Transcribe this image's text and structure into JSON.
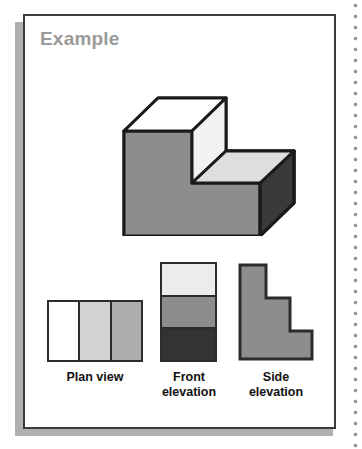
{
  "page": {
    "background_color": "#ffffff",
    "perforation_color": "#9a9a9a"
  },
  "card": {
    "title": "Example",
    "title_color": "#9a9a9a",
    "border_color": "#3b3b3b",
    "shadow_color": "#b0b0b0",
    "background_color": "#ffffff"
  },
  "isometric": {
    "name": "three-step-staircase-solid",
    "outline_color": "#1a1a1a",
    "faces": [
      {
        "name": "top-face-step-1",
        "color": "#ffffff"
      },
      {
        "name": "riser-face-step-1",
        "color": "#efefef"
      },
      {
        "name": "top-face-step-2",
        "color": "#e2e2e2"
      },
      {
        "name": "riser-face-step-2",
        "color": "#d9d9d9"
      },
      {
        "name": "top-face-step-3",
        "color": "#cfcfcf"
      },
      {
        "name": "front-face",
        "color": "#8d8d8d"
      },
      {
        "name": "right-side-face",
        "color": "#3a3a3a"
      }
    ]
  },
  "views": {
    "plan": {
      "label": "Plan view",
      "strips": [
        {
          "name": "strip-near",
          "color": "#ffffff"
        },
        {
          "name": "strip-middle",
          "color": "#d2d2d2"
        },
        {
          "name": "strip-far",
          "color": "#adadad"
        }
      ]
    },
    "front": {
      "label": "Front\nelevation",
      "label_line1": "Front",
      "label_line2": "elevation",
      "bands": [
        {
          "name": "band-top",
          "color": "#ececec"
        },
        {
          "name": "band-middle",
          "color": "#8d8d8d"
        },
        {
          "name": "band-bottom",
          "color": "#333333"
        }
      ]
    },
    "side": {
      "label_line1": "Side",
      "label_line2": "elevation",
      "fill_color": "#8d8d8d",
      "outline_color": "#2c2c2c",
      "shape": "three-step-staircase-profile"
    }
  }
}
